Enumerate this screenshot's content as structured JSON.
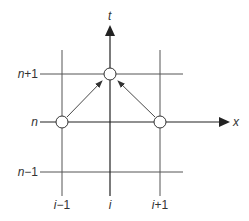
{
  "diagram": {
    "type": "finite-difference stencil",
    "axes": {
      "vertical": {
        "label": "t"
      },
      "horizontal": {
        "label": "x"
      }
    },
    "row_labels": [
      {
        "id": "n_plus_1",
        "text_var": "n",
        "text_suffix": "+1"
      },
      {
        "id": "n",
        "text_var": "n",
        "text_suffix": ""
      },
      {
        "id": "n_minus_1",
        "text_var": "n",
        "text_suffix": "−1"
      }
    ],
    "column_labels": [
      {
        "id": "i_minus_1",
        "text_var": "i",
        "text_suffix": "−1"
      },
      {
        "id": "i",
        "text_var": "i",
        "text_suffix": ""
      },
      {
        "id": "i_plus_1",
        "text_var": "i",
        "text_suffix": "+1"
      }
    ],
    "nodes": [
      {
        "id": "node-i-n+1",
        "col": "i",
        "row": "n+1"
      },
      {
        "id": "node-i-1-n",
        "col": "i-1",
        "row": "n"
      },
      {
        "id": "node-i+1-n",
        "col": "i+1",
        "row": "n"
      }
    ],
    "arrows": [
      {
        "from": "(i-1, n)",
        "to": "(i, n+1)"
      },
      {
        "from": "(i+1, n)",
        "to": "(i, n+1)"
      }
    ],
    "colors": {
      "line": "#555555",
      "axis": "#222222",
      "node_fill": "#ffffff",
      "text": "#333333"
    }
  }
}
